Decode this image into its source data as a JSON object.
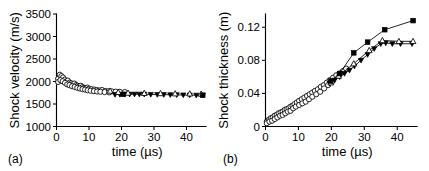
{
  "figure": {
    "panel_a_label": "(a)",
    "panel_b_label": "(b)"
  },
  "chart_data": [
    {
      "id": "panel-a",
      "type": "scatter",
      "title": "",
      "panel_label": "(a)",
      "xlabel": "time (µs)",
      "ylabel": "Shock velocity (m/s)",
      "xlim": [
        0,
        46
      ],
      "ylim": [
        1000,
        3500
      ],
      "xticks": [
        0,
        10,
        20,
        30,
        40
      ],
      "xticklabels": [
        "0",
        "10",
        "20",
        "30",
        "40"
      ],
      "yticks": [
        1000,
        1500,
        2000,
        2500,
        3000,
        3500
      ],
      "yticklabels": [
        "1000",
        "1500",
        "2000",
        "2500",
        "3000",
        "3500"
      ],
      "grid": false,
      "legend": "none",
      "series": [
        {
          "name": "open-circles",
          "marker": "circle-open",
          "line": false,
          "x": [
            0.5,
            1.0,
            1.5,
            2.0,
            2.5,
            3.0,
            3.5,
            4.0,
            4.5,
            5.0,
            5.5,
            6.0,
            6.5,
            7.0,
            7.5,
            8.0,
            8.5,
            9.0,
            9.5,
            10.0,
            10.8,
            11.6,
            12.4,
            13.2,
            14.0,
            15.0,
            16.0,
            17.0,
            18.2,
            19.5,
            21.0
          ],
          "y": [
            2060,
            2150,
            2120,
            2090,
            2040,
            2000,
            2020,
            1975,
            1960,
            1940,
            1955,
            1920,
            1905,
            1890,
            1905,
            1875,
            1860,
            1850,
            1865,
            1840,
            1830,
            1820,
            1810,
            1800,
            1810,
            1790,
            1785,
            1780,
            1775,
            1770,
            1765
          ]
        },
        {
          "name": "open-circles-lower",
          "marker": "circle-open",
          "line": false,
          "x": [
            0.5,
            1.2,
            1.9,
            2.6,
            3.3,
            4.0,
            4.8,
            5.6,
            6.4,
            7.2,
            8.0,
            8.8,
            9.6,
            10.5,
            11.5,
            12.5,
            13.5,
            14.8,
            16.2
          ],
          "y": [
            1990,
            2030,
            2005,
            1970,
            1935,
            1920,
            1895,
            1880,
            1860,
            1845,
            1830,
            1820,
            1805,
            1795,
            1785,
            1778,
            1772,
            1765,
            1758
          ]
        },
        {
          "name": "filled-down-triangles",
          "marker": "triangle-down-filled",
          "line": true,
          "x": [
            18.0,
            19.5,
            21.0,
            22.5,
            24.0,
            25.5,
            27.0,
            29.0,
            31.0,
            33.0,
            35.0,
            37.0,
            39.0,
            41.0,
            43.0,
            45.0
          ],
          "y": [
            1710,
            1712,
            1715,
            1716,
            1718,
            1718,
            1716,
            1712,
            1710,
            1708,
            1706,
            1704,
            1700,
            1698,
            1696,
            1694
          ]
        },
        {
          "name": "open-triangles",
          "marker": "triangle-up-open",
          "line": false,
          "x": [
            16.5,
            19.0,
            22.0,
            27.0,
            32.0,
            36.5,
            41.0,
            44.5
          ],
          "y": [
            1790,
            1760,
            1745,
            1740,
            1735,
            1730,
            1728,
            1722
          ]
        },
        {
          "name": "filled-squares",
          "marker": "square-filled",
          "line": false,
          "x": [
            20.5,
            45.0
          ],
          "y": [
            1715,
            1695
          ]
        }
      ]
    },
    {
      "id": "panel-b",
      "type": "scatter",
      "title": "",
      "panel_label": "(b)",
      "xlabel": "time (µs)",
      "ylabel": "Shock thickness (m)",
      "xlim": [
        0,
        46
      ],
      "ylim": [
        0,
        0.136
      ],
      "xticks": [
        0,
        10,
        20,
        30,
        40
      ],
      "xticklabels": [
        "0",
        "10",
        "20",
        "30",
        "40"
      ],
      "yticks": [
        0,
        0.04,
        0.08,
        0.12
      ],
      "yticklabels": [
        "0",
        "0.04",
        "0.08",
        "0.12"
      ],
      "grid": false,
      "legend": "none",
      "series": [
        {
          "name": "open-circles",
          "marker": "circle-open",
          "line": false,
          "x": [
            0.4,
            1.0,
            1.6,
            2.2,
            2.8,
            3.4,
            4.0,
            4.6,
            5.2,
            5.8,
            6.4,
            7.0,
            7.6,
            8.2,
            8.8,
            9.5,
            10.2,
            11.0,
            11.8,
            12.6,
            13.4,
            14.2,
            15.0,
            15.9,
            16.8,
            17.7,
            18.6,
            19.5,
            20.5,
            21.5,
            22.5,
            23.5,
            24.5
          ],
          "y": [
            0.006,
            0.008,
            0.01,
            0.011,
            0.013,
            0.014,
            0.016,
            0.017,
            0.018,
            0.02,
            0.021,
            0.022,
            0.024,
            0.025,
            0.027,
            0.029,
            0.031,
            0.033,
            0.035,
            0.037,
            0.039,
            0.041,
            0.043,
            0.045,
            0.048,
            0.05,
            0.053,
            0.056,
            0.059,
            0.062,
            0.064,
            0.067,
            0.07
          ]
        },
        {
          "name": "open-circles-lower",
          "marker": "circle-open",
          "line": false,
          "x": [
            0.4,
            1.2,
            2.0,
            2.8,
            3.6,
            4.4,
            5.2,
            6.0,
            6.8,
            7.6,
            8.4,
            9.2,
            10.2,
            11.2,
            12.2,
            13.2,
            14.2,
            15.4,
            16.6,
            17.8,
            19.0,
            20.2
          ],
          "y": [
            0.004,
            0.006,
            0.007,
            0.009,
            0.011,
            0.013,
            0.014,
            0.016,
            0.018,
            0.019,
            0.022,
            0.024,
            0.026,
            0.028,
            0.03,
            0.033,
            0.036,
            0.039,
            0.042,
            0.046,
            0.05,
            0.054
          ]
        },
        {
          "name": "filled-down-triangles",
          "marker": "triangle-down-filled",
          "line": true,
          "x": [
            19.5,
            21.0,
            22.5,
            24.0,
            25.5,
            27.0,
            29.0,
            31.0,
            33.0,
            35.0,
            36.5,
            38.5,
            41.0,
            44.5
          ],
          "y": [
            0.052,
            0.056,
            0.06,
            0.064,
            0.068,
            0.073,
            0.08,
            0.087,
            0.094,
            0.1,
            0.101,
            0.1,
            0.1,
            0.1
          ]
        },
        {
          "name": "open-triangles",
          "marker": "triangle-up-open",
          "line": true,
          "x": [
            19.8,
            22.2,
            26.8,
            31.5,
            35.5,
            40.5,
            44.8
          ],
          "y": [
            0.053,
            0.061,
            0.076,
            0.092,
            0.104,
            0.103,
            0.103
          ]
        },
        {
          "name": "filled-squares",
          "marker": "square-filled",
          "line": true,
          "x": [
            19.8,
            22.5,
            26.8,
            31.0,
            36.2,
            44.8
          ],
          "y": [
            0.055,
            0.064,
            0.089,
            0.102,
            0.117,
            0.128
          ]
        }
      ]
    }
  ]
}
